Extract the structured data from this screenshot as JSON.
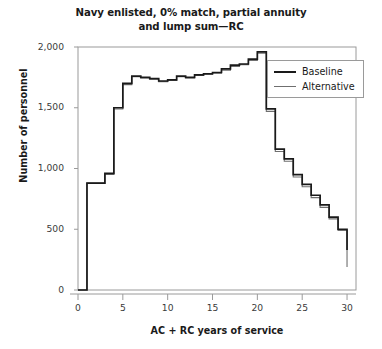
{
  "chart_data": {
    "type": "line",
    "subtype": "step",
    "title": "Navy enlisted, 0% match, partial annuity and lump sum—RC",
    "title_line1": "Navy enlisted, 0% match, partial annuity",
    "title_line2": "and lump sum—RC",
    "xlabel": "AC + RC years of service",
    "ylabel": "Number of personnel",
    "xlim": [
      0,
      31
    ],
    "ylim": [
      0,
      2000
    ],
    "xticks": [
      0,
      5,
      10,
      15,
      20,
      25,
      30
    ],
    "xtick_labels": [
      "0",
      "5",
      "10",
      "15",
      "20",
      "25",
      "30"
    ],
    "yticks": [
      0,
      500,
      1000,
      1500,
      2000
    ],
    "ytick_labels": [
      "0",
      "500",
      "1,000",
      "1,500",
      "2,000"
    ],
    "grid": false,
    "legend_position": "top-right",
    "x": [
      0,
      1,
      2,
      3,
      4,
      5,
      6,
      7,
      8,
      9,
      10,
      11,
      12,
      13,
      14,
      15,
      16,
      17,
      18,
      19,
      20,
      21,
      22,
      23,
      24,
      25,
      26,
      27,
      28,
      29,
      30
    ],
    "series": [
      {
        "name": "Baseline",
        "color": "#1a1a1a",
        "width": 1.7,
        "values": [
          0,
          880,
          880,
          960,
          1500,
          1700,
          1760,
          1750,
          1740,
          1720,
          1730,
          1760,
          1750,
          1770,
          1780,
          1790,
          1820,
          1850,
          1860,
          1900,
          1960,
          1490,
          1160,
          1080,
          950,
          870,
          780,
          700,
          600,
          500,
          330
        ]
      },
      {
        "name": "Alternative",
        "color": "#6f6f6f",
        "width": 1.1,
        "values": [
          0,
          880,
          880,
          950,
          1490,
          1690,
          1755,
          1745,
          1735,
          1715,
          1725,
          1755,
          1745,
          1765,
          1775,
          1785,
          1810,
          1840,
          1855,
          1890,
          1950,
          1470,
          1140,
          1060,
          930,
          850,
          760,
          680,
          585,
          490,
          190
        ]
      }
    ]
  },
  "legend": {
    "entries": [
      {
        "label": "Baseline"
      },
      {
        "label": "Alternative"
      }
    ]
  },
  "axis_colors": {
    "spine": "#9a9a9a",
    "tick": "#9a9a9a",
    "text": "#3b3b3b"
  }
}
